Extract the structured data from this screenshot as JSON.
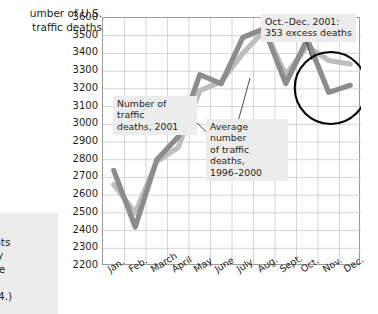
{
  "axis_title": "umber of U.S.\ntraffic deaths",
  "side_note": "rper\nflights\nadily\nn the\neri-\n2004.)",
  "annotations": {
    "series_2001_label": "Number of traffic\ndeaths, 2001",
    "series_avg_label": "Average number\nof traffic deaths,\n1996–2000",
    "excess_label": "Oct.–Dec. 2001:\n353 excess deaths"
  },
  "colors": {
    "series_2001": "#8c8c8c",
    "series_avg": "#bdbdbd",
    "grid": "#c9c9c9",
    "axis": "#9a9a9a",
    "callout_bg": "#ececec",
    "text": "#231f20",
    "circle": "#000000"
  },
  "chart_data": {
    "type": "line",
    "title": "",
    "xlabel": "",
    "ylabel": "Number of U.S. traffic deaths",
    "categories": [
      "Jan.",
      "Feb.",
      "March",
      "April",
      "May",
      "June",
      "July",
      "Aug.",
      "Sept.",
      "Oct.",
      "Nov.",
      "Dec."
    ],
    "ylim": [
      2200,
      3600
    ],
    "ytick_labels": [
      "3600",
      "3500",
      "3400",
      "3300",
      "3200",
      "3100",
      "3000",
      "2900",
      "2800",
      "2700",
      "2600",
      "2500",
      "2400",
      "2300",
      "2200"
    ],
    "ytick_values": [
      3600,
      3500,
      3400,
      3300,
      3200,
      3100,
      3000,
      2900,
      2800,
      2700,
      2600,
      2500,
      2400,
      2300,
      2200
    ],
    "grid": true,
    "legend": "none",
    "series": [
      {
        "name": "Number of traffic deaths, 2001",
        "color": "#8c8c8c",
        "values": [
          2740,
          2420,
          2800,
          2930,
          3280,
          3230,
          3490,
          3540,
          3230,
          3480,
          3180,
          3220
        ]
      },
      {
        "name": "Average number of traffic deaths, 1996–2000",
        "color": "#bdbdbd",
        "values": [
          2660,
          2500,
          2790,
          2870,
          3190,
          3240,
          3400,
          3530,
          3280,
          3440,
          3360,
          3340
        ]
      }
    ],
    "highlight": {
      "shape": "ellipse",
      "label": "Oct.–Dec. 2001: 353 excess deaths",
      "months": [
        "Oct.",
        "Nov.",
        "Dec."
      ]
    }
  }
}
